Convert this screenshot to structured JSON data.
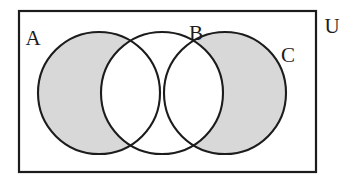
{
  "figure": {
    "type": "venn-diagram",
    "background_color": "#ffffff",
    "stroke_color": "#1c1c1c",
    "shade_color": "#d8d8d8"
  },
  "universe": {
    "label": "U",
    "label_x": 332,
    "label_y": 33,
    "rect": {
      "x": 19,
      "y": 11,
      "width": 297,
      "height": 161,
      "stroke_width": 2.2
    }
  },
  "sets": [
    {
      "id": "A",
      "label": "A",
      "label_x": 33,
      "label_y": 45,
      "cx": 99,
      "cy": 93,
      "r": 61,
      "shaded": true
    },
    {
      "id": "B",
      "label": "B",
      "label_x": 196,
      "label_y": 40,
      "cx": 162,
      "cy": 93,
      "r": 61,
      "shaded": false
    },
    {
      "id": "C",
      "label": "C",
      "label_x": 288,
      "label_y": 62,
      "cx": 225,
      "cy": 93,
      "r": 61,
      "shaded": true
    }
  ],
  "shading": {
    "expression": "(A ∪ C) − B",
    "regions_filled": [
      "A only",
      "C only"
    ],
    "regions_empty": [
      "B only",
      "A ∩ B",
      "B ∩ C",
      "outside circles"
    ],
    "fill": "#d8d8d8"
  }
}
